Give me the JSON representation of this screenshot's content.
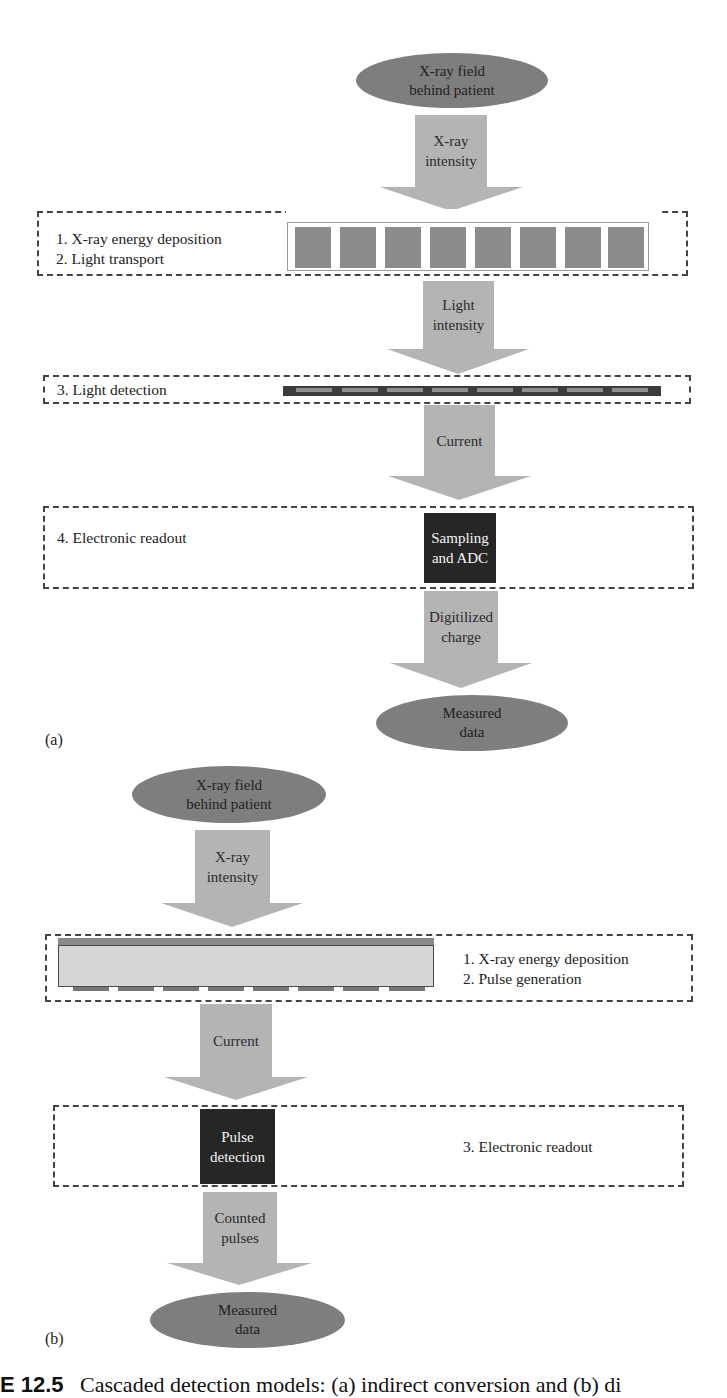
{
  "panel_a": {
    "tag": "(a)",
    "source": {
      "line1": "X-ray field",
      "line2": "behind patient"
    },
    "arrows": [
      {
        "line1": "X-ray",
        "line2": "intensity"
      },
      {
        "line1": "Light",
        "line2": "intensity"
      },
      {
        "line1": "Current",
        "line2": ""
      },
      {
        "line1": "Digitilized",
        "line2": "charge"
      }
    ],
    "stages": [
      {
        "line1": "1. X-ray energy deposition",
        "line2": "2. Light transport"
      },
      {
        "line1": "3. Light detection"
      },
      {
        "line1": "4. Electronic readout"
      }
    ],
    "scintillator_elements": 8,
    "photodetector_cells": 8,
    "readout_box": {
      "line1": "Sampling",
      "line2": "and ADC"
    },
    "output": {
      "line1": "Measured",
      "line2": "data"
    }
  },
  "panel_b": {
    "tag": "(b)",
    "source": {
      "line1": "X-ray field",
      "line2": "behind patient"
    },
    "arrows": [
      {
        "line1": "X-ray",
        "line2": "intensity"
      },
      {
        "line1": "Current",
        "line2": ""
      },
      {
        "line1": "Counted",
        "line2": "pulses"
      }
    ],
    "stages": [
      {
        "line1": "1. X-ray energy deposition",
        "line2": "2. Pulse generation"
      },
      {
        "line1": "3. Electronic readout"
      }
    ],
    "pixel_pads": 8,
    "readout_box": {
      "line1": "Pulse",
      "line2": "detection"
    },
    "output": {
      "line1": "Measured",
      "line2": "data"
    }
  },
  "caption": {
    "figure_number": "E 12.5",
    "text": "Cascaded detection models: (a) indirect conversion and (b) di"
  },
  "colors": {
    "ellipse": "#7e7e7e",
    "arrow": "#b4b4b4",
    "dark_box": "#262626",
    "scintillator": "#8c8c8c",
    "dashed_border": "#444444"
  }
}
